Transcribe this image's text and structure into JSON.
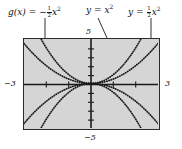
{
  "figure": {
    "kind": "graphing-calculator-viewport",
    "panel_background": "#d5d5d5",
    "panel_border_color": "#2a2a2a",
    "curve_color": "#1a1a1a",
    "axis_color": "#1a1a1a"
  },
  "labels": {
    "g_of_x": {
      "lhs": "g(x)",
      "eq": "=",
      "sign": "−",
      "frac_num": "1",
      "frac_den": "2",
      "var": "x",
      "exp": "2",
      "plain": "g(x) = −1/2 x²"
    },
    "y_eq_x2": {
      "lhs": "y",
      "eq": "=",
      "var": "x",
      "exp": "2",
      "plain": "y = x²"
    },
    "y_eq_half_x2": {
      "lhs": "y",
      "eq": "=",
      "frac_num": "1",
      "frac_den": "2",
      "var": "x",
      "exp": "2",
      "plain": "y = 1/2 x²"
    }
  },
  "axis_numbers": {
    "left": "−3",
    "right": "3",
    "top": "5",
    "bottom": "−5"
  },
  "chart_data": {
    "type": "line",
    "title": "",
    "xlabel": "",
    "ylabel": "",
    "xlim": [
      -3,
      3
    ],
    "ylim": [
      -5,
      5
    ],
    "grid": false,
    "legend": "annotations-with-leader-arrows",
    "tick_labels": {
      "x": [
        "−3",
        "3"
      ],
      "y": [
        "−5",
        "5"
      ]
    },
    "x_tick_step": 1,
    "y_tick_step": 1,
    "line_style": "dotted",
    "series": [
      {
        "name": "y = x²",
        "equation": "y = x^2",
        "coefficient": 1,
        "opens": "up",
        "x": [
          -2.24,
          -2.0,
          -1.75,
          -1.5,
          -1.25,
          -1.0,
          -0.75,
          -0.5,
          -0.25,
          0,
          0.25,
          0.5,
          0.75,
          1.0,
          1.25,
          1.5,
          1.75,
          2.0,
          2.24
        ],
        "values": [
          5.0,
          4.0,
          3.06,
          2.25,
          1.56,
          1.0,
          0.56,
          0.25,
          0.06,
          0,
          0.06,
          0.25,
          0.56,
          1.0,
          1.56,
          2.25,
          3.06,
          4.0,
          5.0
        ]
      },
      {
        "name": "y = 1/2 x²",
        "equation": "y = 0.5x^2",
        "coefficient": 0.5,
        "opens": "up",
        "x": [
          -3,
          -2.5,
          -2.0,
          -1.5,
          -1.0,
          -0.5,
          0,
          0.5,
          1.0,
          1.5,
          2.0,
          2.5,
          3
        ],
        "values": [
          4.5,
          3.13,
          2.0,
          1.13,
          0.5,
          0.13,
          0,
          0.13,
          0.5,
          1.13,
          2.0,
          3.13,
          4.5
        ]
      },
      {
        "name": "y = −x²",
        "equation": "y = -x^2",
        "coefficient": -1,
        "opens": "down",
        "x": [
          -2.24,
          -2.0,
          -1.5,
          -1.0,
          -0.5,
          0,
          0.5,
          1.0,
          1.5,
          2.0,
          2.24
        ],
        "values": [
          -5.0,
          -4.0,
          -2.25,
          -1.0,
          -0.25,
          0,
          -0.25,
          -1.0,
          -2.25,
          -4.0,
          -5.0
        ]
      },
      {
        "name": "g(x) = −1/2 x²",
        "equation": "y = -0.5x^2",
        "coefficient": -0.5,
        "opens": "down",
        "x": [
          -3,
          -2.5,
          -2.0,
          -1.5,
          -1.0,
          -0.5,
          0,
          0.5,
          1.0,
          1.5,
          2.0,
          2.5,
          3
        ],
        "values": [
          -4.5,
          -3.13,
          -2.0,
          -1.13,
          -0.5,
          -0.13,
          0,
          -0.13,
          -0.5,
          -1.13,
          -2.0,
          -3.13,
          -4.5
        ]
      }
    ],
    "annotations": [
      {
        "text": "g(x) = −1/2 x²",
        "points_to": "lower-left branch of y = −0.5x²"
      },
      {
        "text": "y = x²",
        "points_to": "right branch of y = x²"
      },
      {
        "text": "y = 1/2 x²",
        "points_to": "right branch of y = 0.5x²"
      }
    ]
  }
}
